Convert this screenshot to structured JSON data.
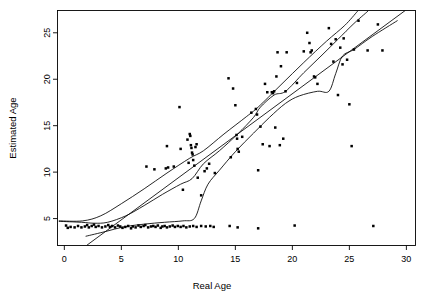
{
  "chart_data": {
    "type": "scatter",
    "title": "",
    "xlabel": "Real Age",
    "ylabel": "Estimated Age",
    "xlim": [
      -0.6,
      30.8
    ],
    "ylim": [
      2.1,
      27.4
    ],
    "xticks": [
      0,
      5,
      10,
      15,
      20,
      25,
      30
    ],
    "yticks": [
      5,
      10,
      15,
      20,
      25
    ],
    "xtick_labels": [
      "0",
      "5",
      "10",
      "15",
      "20",
      "25",
      "30"
    ],
    "ytick_labels": [
      "5",
      "10",
      "15",
      "20",
      "25"
    ],
    "grid": false,
    "legend": null,
    "point_color": "#000000",
    "line_color": "#000000",
    "frame_color": "#000000",
    "background": "#ffffff",
    "series": [
      {
        "name": "Estimated vs Real Age",
        "type": "scatter",
        "marker": "filled-square",
        "points": [
          [
            0.15,
            4.25
          ],
          [
            0.3,
            4.0
          ],
          [
            0.55,
            4.1
          ],
          [
            0.9,
            4.05
          ],
          [
            1.2,
            4.2
          ],
          [
            1.5,
            4.05
          ],
          [
            1.8,
            4.15
          ],
          [
            2.0,
            4.3
          ],
          [
            2.15,
            4.05
          ],
          [
            2.4,
            4.2
          ],
          [
            2.6,
            4.35
          ],
          [
            2.75,
            4.1
          ],
          [
            3.0,
            4.2
          ],
          [
            3.3,
            4.05
          ],
          [
            3.6,
            4.15
          ],
          [
            3.85,
            4.3
          ],
          [
            4.0,
            4.1
          ],
          [
            4.2,
            4.2
          ],
          [
            4.45,
            4.05
          ],
          [
            4.7,
            4.25
          ],
          [
            4.9,
            4.15
          ],
          [
            5.1,
            4.0
          ],
          [
            5.35,
            4.1
          ],
          [
            5.6,
            4.2
          ],
          [
            5.85,
            3.95
          ],
          [
            6.0,
            4.15
          ],
          [
            6.25,
            4.05
          ],
          [
            6.5,
            4.25
          ],
          [
            6.7,
            4.1
          ],
          [
            6.95,
            4.2
          ],
          [
            7.1,
            4.3
          ],
          [
            7.35,
            4.05
          ],
          [
            7.6,
            4.15
          ],
          [
            7.8,
            4.2
          ],
          [
            8.0,
            4.1
          ],
          [
            8.2,
            4.25
          ],
          [
            8.45,
            4.0
          ],
          [
            8.6,
            4.15
          ],
          [
            8.8,
            4.2
          ],
          [
            9.0,
            4.05
          ],
          [
            9.25,
            4.15
          ],
          [
            9.5,
            4.25
          ],
          [
            9.7,
            4.1
          ],
          [
            9.95,
            4.2
          ],
          [
            10.2,
            4.1
          ],
          [
            10.45,
            4.2
          ],
          [
            10.7,
            4.05
          ],
          [
            11.0,
            4.15
          ],
          [
            11.3,
            4.2
          ],
          [
            11.6,
            4.1
          ],
          [
            12.0,
            4.2
          ],
          [
            12.4,
            4.15
          ],
          [
            12.8,
            4.2
          ],
          [
            13.1,
            4.1
          ],
          [
            14.5,
            4.2
          ],
          [
            15.2,
            4.05
          ],
          [
            17.0,
            3.95
          ],
          [
            20.2,
            4.25
          ],
          [
            27.1,
            4.2
          ],
          [
            7.2,
            10.6
          ],
          [
            7.9,
            10.3
          ],
          [
            8.9,
            10.4
          ],
          [
            9.1,
            10.5
          ],
          [
            9.0,
            12.8
          ],
          [
            9.6,
            10.6
          ],
          [
            10.1,
            17.0
          ],
          [
            10.2,
            12.5
          ],
          [
            10.4,
            8.1
          ],
          [
            10.8,
            13.5
          ],
          [
            10.9,
            11.0
          ],
          [
            11.0,
            14.1
          ],
          [
            11.05,
            13.9
          ],
          [
            11.1,
            12.9
          ],
          [
            11.15,
            12.6
          ],
          [
            11.2,
            12.1
          ],
          [
            11.25,
            11.9
          ],
          [
            11.3,
            11.3
          ],
          [
            11.4,
            10.7
          ],
          [
            11.5,
            12.7
          ],
          [
            11.6,
            13.0
          ],
          [
            11.7,
            9.4
          ],
          [
            12.0,
            7.5
          ],
          [
            12.3,
            10.1
          ],
          [
            12.5,
            10.4
          ],
          [
            12.7,
            10.9
          ],
          [
            13.2,
            9.9
          ],
          [
            14.4,
            20.1
          ],
          [
            14.6,
            11.6
          ],
          [
            14.8,
            19.0
          ],
          [
            15.0,
            17.2
          ],
          [
            15.1,
            14.0
          ],
          [
            15.15,
            13.6
          ],
          [
            15.2,
            12.5
          ],
          [
            15.3,
            12.2
          ],
          [
            15.6,
            13.8
          ],
          [
            16.4,
            16.4
          ],
          [
            16.8,
            16.8
          ],
          [
            16.9,
            16.2
          ],
          [
            17.0,
            10.2
          ],
          [
            17.2,
            14.9
          ],
          [
            17.4,
            13.0
          ],
          [
            17.6,
            19.5
          ],
          [
            17.8,
            18.6
          ],
          [
            18.0,
            12.8
          ],
          [
            18.2,
            18.6
          ],
          [
            18.3,
            18.5
          ],
          [
            18.4,
            18.7
          ],
          [
            18.5,
            14.8
          ],
          [
            18.6,
            20.3
          ],
          [
            18.7,
            22.9
          ],
          [
            18.9,
            12.9
          ],
          [
            19.0,
            21.4
          ],
          [
            19.2,
            13.6
          ],
          [
            19.4,
            18.7
          ],
          [
            19.5,
            22.9
          ],
          [
            20.4,
            19.6
          ],
          [
            21.0,
            23.0
          ],
          [
            21.3,
            25.0
          ],
          [
            21.5,
            23.9
          ],
          [
            21.6,
            22.9
          ],
          [
            21.7,
            23.1
          ],
          [
            21.9,
            20.3
          ],
          [
            22.0,
            20.2
          ],
          [
            22.2,
            19.5
          ],
          [
            23.2,
            25.5
          ],
          [
            23.4,
            23.8
          ],
          [
            23.6,
            21.9
          ],
          [
            23.8,
            24.3
          ],
          [
            24.0,
            18.3
          ],
          [
            24.2,
            23.4
          ],
          [
            24.4,
            21.6
          ],
          [
            24.5,
            24.4
          ],
          [
            24.8,
            22.1
          ],
          [
            25.0,
            17.3
          ],
          [
            25.2,
            12.8
          ],
          [
            25.4,
            23.2
          ],
          [
            25.8,
            26.3
          ],
          [
            26.6,
            23.1
          ],
          [
            27.5,
            25.9
          ],
          [
            27.9,
            23.1
          ]
        ]
      },
      {
        "name": "Regression line",
        "type": "line",
        "points": [
          [
            2.0,
            2.15
          ],
          [
            29.9,
            27.4
          ]
        ]
      },
      {
        "name": "Upper band curve",
        "type": "line",
        "points": [
          [
            -0.45,
            4.75
          ],
          [
            1.6,
            4.75
          ],
          [
            3.2,
            5.3
          ],
          [
            5.0,
            6.6
          ],
          [
            7.0,
            8.2
          ],
          [
            9.0,
            9.9
          ],
          [
            11.0,
            11.5
          ],
          [
            12.2,
            12.3
          ],
          [
            14.0,
            14.1
          ],
          [
            16.0,
            16.0
          ],
          [
            17.0,
            17.0
          ],
          [
            19.0,
            19.4
          ],
          [
            21.0,
            21.8
          ],
          [
            23.0,
            24.1
          ],
          [
            24.6,
            25.8
          ],
          [
            25.7,
            27.3
          ]
        ]
      },
      {
        "name": "Middle band curve",
        "type": "line",
        "points": [
          [
            -0.45,
            4.7
          ],
          [
            1.5,
            4.6
          ],
          [
            2.6,
            4.5
          ],
          [
            3.8,
            4.6
          ],
          [
            5.4,
            5.3
          ],
          [
            7.0,
            6.4
          ],
          [
            8.6,
            7.6
          ],
          [
            10.2,
            8.7
          ],
          [
            11.2,
            9.3
          ],
          [
            12.2,
            10.9
          ],
          [
            13.6,
            12.3
          ],
          [
            15.2,
            14.1
          ],
          [
            16.6,
            15.9
          ],
          [
            17.2,
            17.0
          ],
          [
            18.4,
            18.3
          ],
          [
            19.4,
            18.7
          ],
          [
            21.0,
            20.7
          ],
          [
            22.6,
            22.6
          ],
          [
            24.0,
            24.3
          ],
          [
            25.4,
            26.0
          ],
          [
            26.6,
            27.3
          ]
        ]
      },
      {
        "name": "Lower band curve",
        "type": "line",
        "points": [
          [
            1.9,
            3.1
          ],
          [
            3.6,
            3.6
          ],
          [
            5.2,
            4.1
          ],
          [
            7.0,
            4.4
          ],
          [
            8.8,
            4.6
          ],
          [
            10.4,
            4.75
          ],
          [
            11.4,
            5.0
          ],
          [
            12.0,
            6.9
          ],
          [
            12.6,
            8.7
          ],
          [
            13.6,
            10.2
          ],
          [
            15.0,
            12.2
          ],
          [
            16.6,
            14.2
          ],
          [
            18.0,
            15.9
          ],
          [
            19.4,
            17.4
          ],
          [
            20.6,
            18.2
          ],
          [
            22.2,
            18.7
          ],
          [
            23.2,
            18.7
          ],
          [
            23.8,
            20.6
          ],
          [
            24.4,
            22.5
          ],
          [
            25.4,
            23.2
          ],
          [
            27.0,
            24.6
          ],
          [
            29.2,
            26.3
          ]
        ]
      }
    ]
  }
}
